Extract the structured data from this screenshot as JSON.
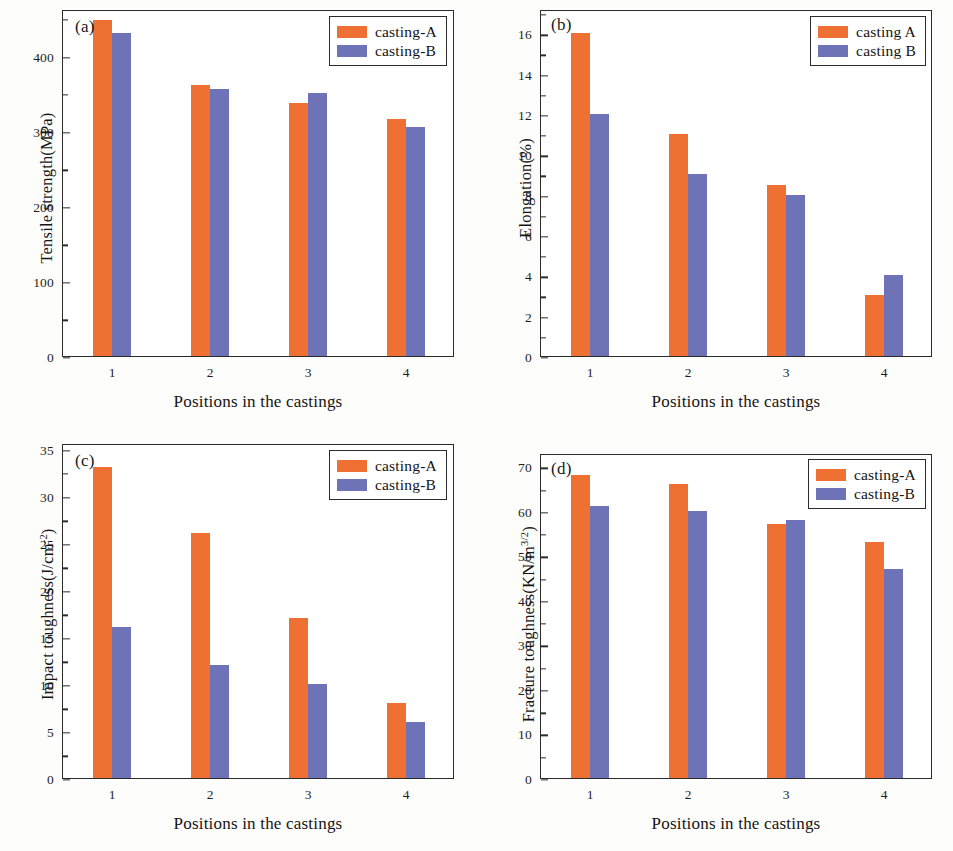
{
  "figure": {
    "background": "#fdfdfb",
    "series_colors": {
      "casting_a": "#ee7032",
      "casting_b": "#6e72b7"
    },
    "shared_xlabel": "Positions in the castings",
    "shared_categories": [
      "1",
      "2",
      "3",
      "4"
    ]
  },
  "chart_data": [
    {
      "type": "bar",
      "panel": "(a)",
      "title": "",
      "xlabel": "Positions in the castings",
      "ylabel": "Tensile strength(MPa)",
      "categories": [
        "1",
        "2",
        "3",
        "4"
      ],
      "series": [
        {
          "name": "casting-A",
          "color": "#ee7032",
          "values": [
            447,
            361,
            337,
            316
          ]
        },
        {
          "name": "casting-B",
          "color": "#6e72b7",
          "values": [
            430,
            355,
            350,
            305
          ]
        }
      ],
      "ylim": [
        0,
        462
      ],
      "yticks": [
        0,
        100,
        200,
        300,
        400
      ],
      "ytick_labels": [
        "0",
        "100",
        "200",
        "300",
        "400"
      ],
      "minor_ticks": true,
      "grid": false,
      "legend_position": "top-right"
    },
    {
      "type": "bar",
      "panel": "(b)",
      "title": "",
      "xlabel": "Positions in the castings",
      "ylabel": "Elongation(%)",
      "categories": [
        "1",
        "2",
        "3",
        "4"
      ],
      "series": [
        {
          "name": "casting A",
          "color": "#ee7032",
          "values": [
            16,
            11,
            8.5,
            3
          ]
        },
        {
          "name": "casting B",
          "color": "#6e72b7",
          "values": [
            12,
            9,
            8,
            4
          ]
        }
      ],
      "ylim": [
        0,
        17.2
      ],
      "yticks": [
        0,
        2,
        4,
        6,
        8,
        10,
        12,
        14,
        16
      ],
      "ytick_labels": [
        "0",
        "2",
        "4",
        "6",
        "8",
        "10",
        "12",
        "14",
        "16"
      ],
      "minor_ticks": true,
      "grid": false,
      "legend_position": "top-right"
    },
    {
      "type": "bar",
      "panel": "(c)",
      "title": "",
      "xlabel": "Positions in the castings",
      "ylabel": "Impact toughness(J/cm2)",
      "ylabel_base": "Impact toughness(J/cm",
      "ylabel_sup": "-2",
      "ylabel_tail": ")",
      "categories": [
        "1",
        "2",
        "3",
        "4"
      ],
      "series": [
        {
          "name": "casting-A",
          "color": "#ee7032",
          "values": [
            33,
            26,
            17,
            8
          ]
        },
        {
          "name": "casting-B",
          "color": "#6e72b7",
          "values": [
            16,
            12,
            10,
            6
          ]
        }
      ],
      "ylim": [
        0,
        35.6
      ],
      "yticks": [
        0,
        5,
        10,
        15,
        20,
        25,
        30,
        35
      ],
      "ytick_labels": [
        "0",
        "5",
        "10",
        "15",
        "20",
        "25",
        "30",
        "35"
      ],
      "minor_ticks": true,
      "grid": false,
      "legend_position": "top-right"
    },
    {
      "type": "bar",
      "panel": "(d)",
      "title": "",
      "xlabel": "Positions in the castings",
      "ylabel": "Fracture toughness(KN/m3/2)",
      "ylabel_base": "Fracture toughness(KN/m",
      "ylabel_sup": "3/2",
      "ylabel_tail": ")",
      "categories": [
        "1",
        "2",
        "3",
        "4"
      ],
      "series": [
        {
          "name": "casting-A",
          "color": "#ee7032",
          "values": [
            68,
            66,
            57,
            53
          ]
        },
        {
          "name": "casting-B",
          "color": "#6e72b7",
          "values": [
            61,
            60,
            58,
            47
          ]
        }
      ],
      "ylim": [
        0,
        73
      ],
      "yticks": [
        0,
        10,
        20,
        30,
        40,
        50,
        60,
        70
      ],
      "ytick_labels": [
        "0",
        "10",
        "20",
        "30",
        "40",
        "50",
        "60",
        "70"
      ],
      "minor_ticks": true,
      "grid": false,
      "legend_position": "top-right"
    }
  ]
}
